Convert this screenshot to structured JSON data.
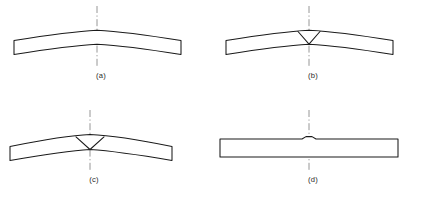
{
  "figure": {
    "background_color": "#ffffff",
    "line_color": "#1a1a1a",
    "centerline_color": "#8a8a8a",
    "label_color": "#2b2b2b",
    "panel_count": 4
  },
  "panels": [
    {
      "id": "a",
      "label": "(a)",
      "description": "Curved beam arched upward, no notch",
      "has_notch": false,
      "center_bump": false,
      "label_x": 101,
      "label_y": 78,
      "centerline": {
        "x": 97,
        "y1": 6,
        "y2": 66
      },
      "beam_path": "M 14,40.5 L 14,54.5 C 45,49.5 72,45.5 97,44.2 C 122,45.5 150,49.5 181,54.5 L 181,40.5 C 150,35.5 122,31.5 97,30.2 C 72,31.5 45,35.5 14,40.5 Z"
    },
    {
      "id": "b",
      "label": "(b)",
      "description": "Curved beam with narrow V-notch cut from top surface to bottom edge",
      "has_notch": true,
      "notch_shape": "narrow-v",
      "center_bump": false,
      "label_x": 313,
      "label_y": 78,
      "centerline": {
        "x": 309,
        "y1": 6,
        "y2": 66
      },
      "beam_path": "M 226,40.5 L 226,54.5 C 257,49.5 284,45.5 309,44.2 C 334,45.5 362,49.5 393,54.5 L 393,40.5 C 362,35.5 334,31.5 309,30.2 C 284,31.5 257,35.5 226,40.5 Z",
      "notch_path": "M 298,31.5 L 309,44.2 L 320,31.5"
    },
    {
      "id": "c",
      "label": "(c)",
      "description": "Beam bent sharper at the notch, notch opened wider and flatter",
      "has_notch": true,
      "notch_shape": "wide-v",
      "center_bump": false,
      "label_x": 94,
      "label_y": 182,
      "centerline": {
        "x": 90,
        "y1": 110,
        "y2": 170
      },
      "beam_path": "M 10,146.5 L 10,160.5 C 42,155.0 66,151.0 90,149.5 C 114,151.0 140,155.0 172,160.5 L 172,146.5 C 140,140.0 114,135.5 90,134.5 C 66,135.5 42,140.0 10,146.5 Z",
      "notch_path": "M 76,136.8 L 90,149.5 L 104,136.8"
    },
    {
      "id": "d",
      "label": "(d)",
      "description": "Straightened flat bar with small residual bump at center",
      "has_notch": false,
      "center_bump": true,
      "label_x": 313,
      "label_y": 182,
      "centerline": {
        "x": 309,
        "y1": 110,
        "y2": 170
      },
      "beam_path": "M 220,139.0 L 220,157.0 L 398,157.0 L 398,139.0 L 316,139.0 L 312,136.6 L 306,136.6 L 302,139.0 Z"
    }
  ]
}
